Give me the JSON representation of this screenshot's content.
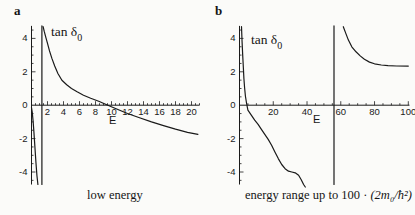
{
  "page": {
    "background": "#fbfbf9",
    "ink": "#1a1a1a"
  },
  "panels": [
    {
      "letter": "a",
      "plot_label": {
        "text": "tan δ",
        "sub": "0"
      },
      "x_axis_label": "E",
      "caption": {
        "text": "low energy",
        "math": ""
      }
    },
    {
      "letter": "b",
      "plot_label": {
        "text": "tan δ",
        "sub": "0"
      },
      "x_axis_label": "E",
      "caption": {
        "text": "energy range up to 100 · ",
        "math": "(2m₀/ħ²)"
      }
    }
  ],
  "chart_data": [
    {
      "id": "a",
      "type": "line",
      "title": "low energy",
      "xlabel": "E",
      "ylabel": "tan δ0",
      "xlim": [
        0,
        21
      ],
      "ylim": [
        -4.75,
        4.75
      ],
      "x_ticks": [
        2,
        4,
        6,
        8,
        10,
        12,
        14,
        16,
        18,
        20
      ],
      "x_minor_step": 0.5,
      "y_ticks": [
        -4,
        -2,
        0,
        2,
        4
      ],
      "y_minor_step": 0.5,
      "grid": false,
      "legend": "none",
      "mapping": {
        "x0": 31.5,
        "sx": 8.0,
        "y0": 105.2,
        "sy": 16.7
      },
      "series": [
        {
          "name": "branch-below-resonance",
          "points": [
            [
              0,
              -0.15
            ],
            [
              0.1,
              -0.45
            ],
            [
              0.2,
              -0.95
            ],
            [
              0.3,
              -1.6
            ],
            [
              0.42,
              -2.5
            ],
            [
              0.55,
              -3.4
            ],
            [
              0.68,
              -4.2
            ],
            [
              0.8,
              -4.75
            ]
          ]
        },
        {
          "name": "resonance-asymptote",
          "points": [
            [
              1.3,
              -4.75
            ],
            [
              1.3,
              4.75
            ]
          ]
        },
        {
          "name": "branch-above-resonance",
          "points": [
            [
              1.45,
              4.7
            ],
            [
              1.6,
              4.4
            ],
            [
              1.8,
              4.05
            ],
            [
              2.0,
              3.7
            ],
            [
              2.25,
              3.25
            ],
            [
              2.55,
              2.8
            ],
            [
              2.9,
              2.35
            ],
            [
              3.3,
              1.9
            ],
            [
              3.8,
              1.5
            ],
            [
              4.4,
              1.22
            ],
            [
              5.0,
              1.0
            ],
            [
              5.7,
              0.8
            ],
            [
              6.5,
              0.6
            ],
            [
              7.4,
              0.42
            ],
            [
              8.4,
              0.24
            ],
            [
              9.4,
              0.03
            ],
            [
              10.5,
              -0.2
            ],
            [
              12,
              -0.5
            ],
            [
              13.5,
              -0.75
            ],
            [
              15,
              -1.0
            ],
            [
              16.5,
              -1.22
            ],
            [
              18,
              -1.43
            ],
            [
              19.5,
              -1.62
            ],
            [
              20.8,
              -1.75
            ]
          ]
        }
      ]
    },
    {
      "id": "b",
      "type": "line",
      "title": "energy range up to 100 · (2m0/ħ²)",
      "xlabel": "E",
      "ylabel": "tan δ0",
      "xlim": [
        0,
        100.7
      ],
      "ylim": [
        -4.75,
        4.75
      ],
      "x_ticks": [
        20,
        40,
        60,
        80,
        100
      ],
      "x_minor_step": 5,
      "y_ticks": [
        -4,
        -2,
        0,
        2,
        4
      ],
      "y_minor_step": 0.5,
      "grid": false,
      "legend": "none",
      "mapping": {
        "x0": 32.5,
        "sx": 1.688,
        "y0": 105.2,
        "sy": 16.7
      },
      "series": [
        {
          "name": "branch-below-resonance",
          "points": [
            [
              1.2,
              4.7
            ],
            [
              1.5,
              3.9
            ],
            [
              1.9,
              3.0
            ],
            [
              2.3,
              2.2
            ],
            [
              2.6,
              1.6
            ],
            [
              3.0,
              1.05
            ],
            [
              3.5,
              0.55
            ],
            [
              4.2,
              0.1
            ],
            [
              5,
              -0.3
            ],
            [
              7,
              -0.6
            ],
            [
              9,
              -0.9
            ],
            [
              11,
              -1.15
            ],
            [
              13,
              -1.45
            ],
            [
              15,
              -1.75
            ],
            [
              17,
              -2.05
            ],
            [
              19,
              -2.4
            ],
            [
              21,
              -2.8
            ],
            [
              23,
              -3.2
            ],
            [
              25,
              -3.55
            ],
            [
              27,
              -3.8
            ],
            [
              29,
              -3.95
            ],
            [
              31,
              -4.0
            ],
            [
              33,
              -4.05
            ],
            [
              35,
              -4.2
            ],
            [
              36.5,
              -4.45
            ],
            [
              38,
              -4.75
            ],
            [
              39,
              -4.9
            ]
          ]
        },
        {
          "name": "resonance-asymptote",
          "points": [
            [
              56,
              -4.75
            ],
            [
              56,
              4.75
            ]
          ]
        },
        {
          "name": "branch-above-resonance",
          "points": [
            [
              61.5,
              4.7
            ],
            [
              63,
              4.3
            ],
            [
              64.5,
              3.9
            ],
            [
              66.5,
              3.5
            ],
            [
              69,
              3.2
            ],
            [
              71.5,
              2.95
            ],
            [
              74,
              2.75
            ],
            [
              77,
              2.58
            ],
            [
              80,
              2.48
            ],
            [
              84,
              2.41
            ],
            [
              88,
              2.37
            ],
            [
              93,
              2.35
            ],
            [
              100,
              2.34
            ]
          ]
        }
      ]
    }
  ]
}
